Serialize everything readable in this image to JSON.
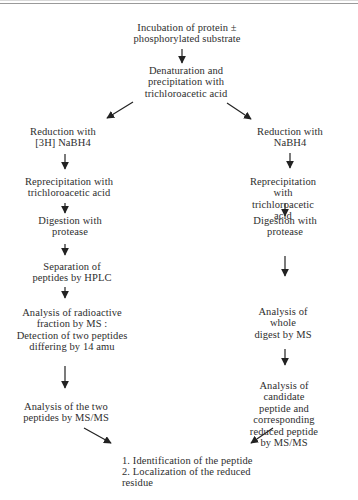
{
  "page": {
    "background": "#ffffff",
    "text_color": "#2e2e2e",
    "arrow_color": "#222222",
    "rule_color": "#9a9a9a"
  },
  "nodes": {
    "incubation": {
      "text": "Incubation of protein ±\nphosphorylated substrate"
    },
    "denaturation": {
      "text": "Denaturation and\nprecipitation with\ntrichloroacetic acid"
    },
    "reduction_left": {
      "text": "Reduction with\n[3H] NaBH4"
    },
    "reduction_right": {
      "text": "Reduction with\nNaBH4"
    },
    "reprecipitation_left": {
      "text": "Reprecipitation with\ntrichloroacetic acid"
    },
    "reprecipitation_right": {
      "text": "Reprecipitation with\ntrichloroacetic acid"
    },
    "digestion_left": {
      "text": "Digestion with\nprotease"
    },
    "digestion_right": {
      "text": "Digestion with\nprotease"
    },
    "separation_hplc": {
      "text": "Separation of\npeptides by HPLC"
    },
    "analysis_radioactive": {
      "text": "Analysis of radioactive\nfraction by MS :\nDetection of two peptides\ndiffering by 14 amu"
    },
    "analysis_whole_digest": {
      "text": "Analysis of whole\ndigest by MS"
    },
    "analysis_two_peptides": {
      "text": "Analysis of the two\npeptides by MS/MS"
    },
    "analysis_candidate": {
      "text": "Analysis of candidate\npeptide and corresponding\nreduced peptide by MS/MS"
    },
    "conclusion": {
      "text": "1. Identification of the peptide\n2. Localization of the reduced\nresidue"
    }
  }
}
